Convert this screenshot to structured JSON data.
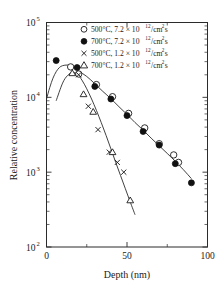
{
  "chart_data": {
    "type": "scatter",
    "title": "",
    "xlabel": "Depth (nm)",
    "ylabel": "Relative concentration",
    "xlim": [
      0,
      100
    ],
    "ylim": [
      100,
      100000
    ],
    "yscale": "log",
    "xscale": "linear",
    "grid": false,
    "legend_position": "top-right",
    "x_ticks": [
      "0",
      "50",
      "100"
    ],
    "x_tick_values": [
      0,
      50,
      100
    ],
    "x_minor_tick_values": [
      25,
      75
    ],
    "y_ticks": [
      "10",
      "10",
      "10",
      "10"
    ],
    "y_tick_exponents": [
      "2",
      "3",
      "4",
      "5"
    ],
    "y_tick_values": [
      100,
      1000,
      10000,
      100000
    ],
    "series": [
      {
        "name": "500°C, 7.2 × 10¹²/cm²s",
        "marker": "open-circle",
        "temperature": "500°C",
        "flux": "7.2 × 10",
        "flux_exponent": "12",
        "flux_units": "/cm",
        "flux_units_sup": "2",
        "flux_units_tail": "s",
        "x": [
          15,
          20,
          31,
          41,
          51,
          61,
          70,
          79,
          82
        ],
        "y": [
          25500,
          20500,
          14800,
          10200,
          6100,
          3900,
          2400,
          1700,
          1350
        ]
      },
      {
        "name": "700°C, 7.2 × 10¹²/cm²s",
        "marker": "filled-circle",
        "temperature": "700°C",
        "flux": "7.2 × 10",
        "flux_exponent": "12",
        "flux_units": "/cm",
        "flux_units_sup": "2",
        "flux_units_tail": "s",
        "x": [
          6,
          19,
          30,
          40,
          50,
          60,
          70,
          80,
          90
        ],
        "y": [
          31000,
          25000,
          14000,
          9500,
          5700,
          3500,
          2300,
          1300,
          720
        ]
      },
      {
        "name": "500°C, 1.2 × 10¹²/cm²s",
        "marker": "cross",
        "temperature": "500°C",
        "flux": "1.2 × 10",
        "flux_exponent": "12",
        "flux_units": "/cm",
        "flux_units_sup": "2",
        "flux_units_tail": "s",
        "x": [
          20,
          26,
          32,
          39,
          44,
          48
        ],
        "y": [
          20000,
          7600,
          3700,
          1850,
          1350,
          1000
        ]
      },
      {
        "name": "700°C, 1.2 × 10¹²/cm²s",
        "marker": "open-triangle",
        "temperature": "700°C",
        "flux": "1.2 × 10",
        "flux_exponent": "12",
        "flux_units": "/cm",
        "flux_units_sup": "2",
        "flux_units_tail": "s",
        "x": [
          16,
          23,
          29,
          41,
          52
        ],
        "y": [
          21000,
          11000,
          6400,
          1850,
          420
        ]
      }
    ],
    "fit_curves": [
      {
        "name": "fit-high-flux",
        "points_x": [
          0,
          2,
          4,
          6,
          8,
          10,
          13,
          16,
          20,
          25,
          30,
          35,
          40,
          45,
          50,
          55,
          60,
          65,
          70,
          75,
          80,
          85,
          90
        ],
        "points_y": [
          9500,
          13500,
          18000,
          22000,
          25000,
          26500,
          27000,
          26000,
          22500,
          19000,
          15200,
          12000,
          9600,
          7500,
          5900,
          4600,
          3650,
          2850,
          2250,
          1780,
          1400,
          1080,
          820
        ]
      },
      {
        "name": "fit-low-flux",
        "points_x": [
          6,
          10,
          13,
          16,
          19,
          22,
          25,
          28,
          31,
          34,
          37,
          40,
          43,
          46,
          49,
          52,
          55
        ],
        "points_y": [
          9000,
          15500,
          19500,
          21500,
          20500,
          17000,
          13000,
          9500,
          6700,
          4600,
          3100,
          2050,
          1350,
          900,
          600,
          400,
          270
        ]
      }
    ]
  },
  "legend": {
    "entries": [
      {
        "marker": "open-circle",
        "temp": "500°C, ",
        "mant": "7.2 × 10",
        "exp": "12",
        "unit": "/cm",
        "unit_sup": "2",
        "tail": "s"
      },
      {
        "marker": "filled-circle",
        "temp": "700°C, ",
        "mant": "7.2 × 10",
        "exp": "12",
        "unit": "/cm",
        "unit_sup": "2",
        "tail": "s"
      },
      {
        "marker": "cross",
        "temp": "500°C, ",
        "mant": "1.2 × 10",
        "exp": "12",
        "unit": "/cm",
        "unit_sup": "2",
        "tail": "s"
      },
      {
        "marker": "open-triangle",
        "temp": "700°C, ",
        "mant": "1.2 × 10",
        "exp": "12",
        "unit": "/cm",
        "unit_sup": "2",
        "tail": "s"
      }
    ]
  },
  "colors": {
    "axis": "#2b2b2b",
    "marker_stroke": "#1a1a1a",
    "marker_fill_open": "#ffffff",
    "marker_fill_solid": "#111111",
    "background": "#ffffff"
  }
}
